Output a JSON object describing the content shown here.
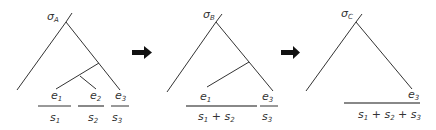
{
  "diagram": {
    "colors": {
      "line": "#333333",
      "merged_segment": "#888888",
      "arrow": "#111111",
      "text": "#333333"
    },
    "panels": [
      {
        "id": "A",
        "root_label": {
          "base": "σ",
          "sub": "A"
        },
        "leaf_labels": [
          {
            "base": "e",
            "sub": "1"
          },
          {
            "base": "e",
            "sub": "2"
          },
          {
            "base": "e",
            "sub": "3"
          }
        ],
        "segments": [
          {
            "label": [
              {
                "base": "s",
                "sub": "1"
              }
            ],
            "merged": false
          },
          {
            "label": [
              {
                "base": "s",
                "sub": "2"
              }
            ],
            "merged": true
          },
          {
            "label": [
              {
                "base": "s",
                "sub": "3"
              }
            ],
            "merged": false
          }
        ]
      },
      {
        "id": "B",
        "root_label": {
          "base": "σ",
          "sub": "B"
        },
        "leaf_labels": [
          {
            "base": "e",
            "sub": "1"
          },
          {
            "base": "e",
            "sub": "3"
          }
        ],
        "segments": [
          {
            "text": "s1 + s2",
            "merged": true
          },
          {
            "text": "s3",
            "merged": false
          }
        ]
      },
      {
        "id": "C",
        "root_label": {
          "base": "σ",
          "sub": "C"
        },
        "leaf_labels": [
          {
            "base": "e",
            "sub": "3"
          }
        ],
        "segments": [
          {
            "text": "s1 + s2 + s3",
            "merged": true
          }
        ]
      }
    ],
    "arrows": [
      {
        "from": "A",
        "to": "B",
        "icon": "right-arrow-icon"
      },
      {
        "from": "B",
        "to": "C",
        "icon": "right-arrow-icon"
      }
    ],
    "text": {
      "sigma": "σ",
      "e": "e",
      "s": "s",
      "plus": " + ",
      "sub_A": "A",
      "sub_B": "B",
      "sub_C": "C",
      "sub_1": "1",
      "sub_2": "2",
      "sub_3": "3"
    }
  }
}
